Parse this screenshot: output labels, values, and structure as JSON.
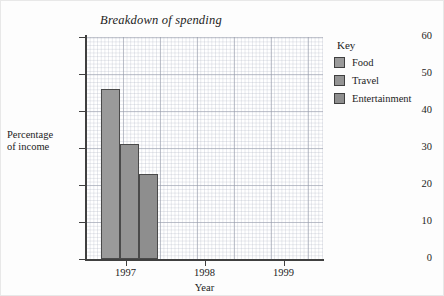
{
  "chart_data": {
    "type": "bar",
    "title": "Breakdown of spending",
    "xlabel": "Year",
    "ylabel": "Percentage\nof income",
    "ylabel_line1": "Percentage",
    "ylabel_line2": "of income",
    "categories": [
      "1997",
      "1998",
      "1999"
    ],
    "ylim": [
      0,
      60
    ],
    "ytick_step": 10,
    "yticks": [
      "60",
      "50",
      "40",
      "30",
      "20",
      "10",
      "0"
    ],
    "grid": true,
    "legend_position": "right",
    "legend_title": "Key",
    "series": [
      {
        "name": "Food",
        "color": "#9a9a9a",
        "values": [
          46,
          null,
          null
        ]
      },
      {
        "name": "Travel",
        "color": "#949494",
        "values": [
          31,
          null,
          null
        ]
      },
      {
        "name": "Entertainment",
        "color": "#8e8e8e",
        "values": [
          23,
          null,
          null
        ]
      }
    ]
  },
  "legend": {
    "title": "Key",
    "items": [
      {
        "label": "Food",
        "color": "#9a9a9a"
      },
      {
        "label": "Travel",
        "color": "#949494"
      },
      {
        "label": "Entertainment",
        "color": "#8e8e8e"
      }
    ]
  },
  "axes": {
    "y_title_line1": "Percentage",
    "y_title_line2": "of income",
    "x_title": "Year",
    "y_ticks": [
      "60",
      "50",
      "40",
      "30",
      "20",
      "10",
      "0"
    ],
    "x_ticks": [
      "1997",
      "1998",
      "1999"
    ]
  },
  "colors": {
    "axis": "#404040",
    "grid_major": "#969baa",
    "grid_minor": "#afb4c3",
    "bar_border": "#4a4a4a",
    "text": "#1c1c1c",
    "background": "#fdfdfd"
  }
}
